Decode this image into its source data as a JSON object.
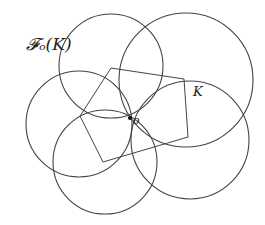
{
  "labels": {
    "family": "𝓕ₒ(K)",
    "body": "K",
    "origin": "o"
  },
  "colors": {
    "stroke": "#444444",
    "background": "#ffffff"
  },
  "geometry": {
    "origin": {
      "x": 130,
      "y": 118
    },
    "circles": [
      {
        "name": "circle-top",
        "cx": 111,
        "cy": 66,
        "r": 52
      },
      {
        "name": "circle-top-right",
        "cx": 186,
        "cy": 80,
        "r": 67
      },
      {
        "name": "circle-left",
        "cx": 79,
        "cy": 124,
        "r": 53
      },
      {
        "name": "circle-bottom-right",
        "cx": 190,
        "cy": 140,
        "r": 59
      },
      {
        "name": "circle-bottom",
        "cx": 105,
        "cy": 162,
        "r": 52
      }
    ],
    "polygon_K": [
      [
        111,
        68
      ],
      [
        184,
        79
      ],
      [
        188,
        137
      ],
      [
        103,
        162
      ],
      [
        80,
        116
      ]
    ]
  }
}
